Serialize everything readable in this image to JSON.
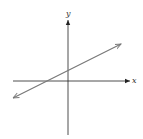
{
  "diagram": {
    "type": "coordinate-plane-line",
    "axes": {
      "x_label": "x",
      "y_label": "y",
      "color": "#222222"
    },
    "line": {
      "description": "straight line with positive slope, arrows at both ends, positive y-intercept, negative x-intercept",
      "color": "#777777"
    }
  }
}
